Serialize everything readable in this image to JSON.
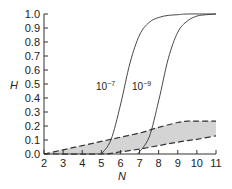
{
  "chart_data": {
    "type": "line",
    "title": "",
    "xlabel": "N",
    "ylabel": "H",
    "xlim": [
      2,
      11
    ],
    "ylim": [
      0.0,
      1.0
    ],
    "x_ticks": [
      "2",
      "3",
      "4",
      "5",
      "6",
      "7",
      "8",
      "9",
      "10",
      "11"
    ],
    "y_ticks": [
      "0.0",
      "0.1",
      "0.2",
      "0.3",
      "0.4",
      "0.5",
      "0.6",
      "0.7",
      "0.8",
      "0.9",
      "1.0"
    ],
    "grid": false,
    "series": [
      {
        "name": "10^-7",
        "label": "10⁻⁷",
        "style": "solid",
        "x": [
          5.0,
          5.5,
          6.0,
          6.5,
          7.0,
          7.5,
          8.0,
          8.5,
          9.0,
          9.5,
          11.0
        ],
        "y": [
          0.0,
          0.1,
          0.35,
          0.65,
          0.85,
          0.94,
          0.975,
          0.99,
          0.995,
          1.0,
          1.0
        ]
      },
      {
        "name": "10^-9",
        "label": "10⁻⁹",
        "style": "solid",
        "x": [
          6.9,
          7.5,
          8.0,
          8.5,
          9.0,
          9.5,
          10.0,
          10.5,
          11.0
        ],
        "y": [
          0.0,
          0.12,
          0.38,
          0.68,
          0.87,
          0.95,
          0.985,
          0.995,
          1.0
        ]
      },
      {
        "name": "band-upper",
        "style": "dashed",
        "x": [
          2,
          3,
          4,
          5,
          6,
          7,
          8,
          9,
          9.5,
          10,
          11
        ],
        "y": [
          0.0,
          0.03,
          0.06,
          0.09,
          0.12,
          0.15,
          0.19,
          0.225,
          0.235,
          0.235,
          0.235
        ]
      },
      {
        "name": "band-lower",
        "style": "dashed",
        "x": [
          2,
          5,
          5.5,
          6,
          7,
          8,
          9,
          10,
          11
        ],
        "y": [
          0.0,
          0.0,
          0.005,
          0.015,
          0.035,
          0.06,
          0.085,
          0.105,
          0.13
        ]
      }
    ],
    "annotations": [
      {
        "text": "10⁻⁷",
        "x": 5.4,
        "y": 0.56
      },
      {
        "text": "10⁻⁹",
        "x": 7.1,
        "y": 0.56
      }
    ],
    "shaded_region": {
      "between": [
        "band-upper",
        "band-lower"
      ],
      "color": "#d4d4d4"
    }
  },
  "labels": {
    "xlabel": "N",
    "ylabel": "H",
    "curve_a": "10",
    "curve_a_exp": "−7",
    "curve_b": "10",
    "curve_b_exp": "−9"
  }
}
